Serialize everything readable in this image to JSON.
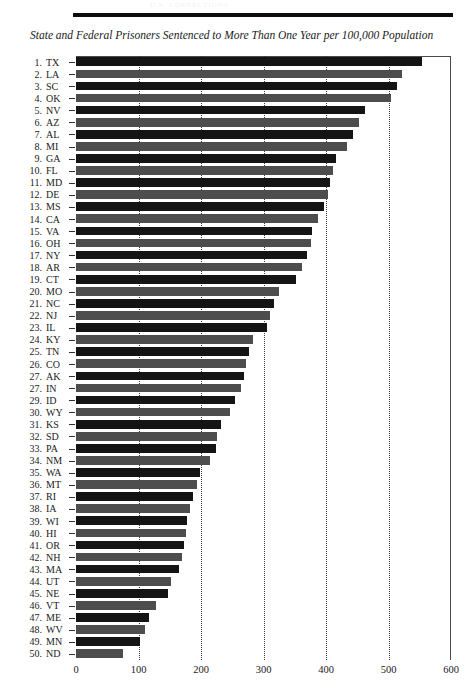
{
  "page": {
    "faint_header": "U.S. CORRECTIONS",
    "title": "State and Federal Prisoners Sentenced to More Than One Year per 100,000 Population"
  },
  "chart_data": {
    "type": "bar",
    "orientation": "horizontal",
    "title": "State and Federal Prisoners Sentenced to More Than One Year per 100,000 Population",
    "xlabel": "",
    "ylabel": "",
    "xlim": [
      0,
      600
    ],
    "xticks": [
      0,
      100,
      200,
      300,
      400,
      500,
      600
    ],
    "grid": "vertical dotted gridlines at 100, 200, 300, 400, 500",
    "legend": "none",
    "ranks": [
      1,
      2,
      3,
      4,
      5,
      6,
      7,
      8,
      9,
      10,
      11,
      12,
      13,
      14,
      15,
      16,
      17,
      18,
      19,
      20,
      21,
      22,
      23,
      24,
      25,
      26,
      27,
      27,
      29,
      30,
      31,
      32,
      33,
      34,
      35,
      36,
      37,
      38,
      39,
      40,
      41,
      42,
      43,
      44,
      45,
      46,
      47,
      48,
      49,
      50
    ],
    "categories": [
      "TX",
      "LA",
      "SC",
      "OK",
      "NV",
      "AZ",
      "AL",
      "MI",
      "GA",
      "FL",
      "MD",
      "DE",
      "MS",
      "CA",
      "VA",
      "OH",
      "NY",
      "AR",
      "CT",
      "MO",
      "NC",
      "NJ",
      "IL",
      "KY",
      "TN",
      "CO",
      "AK",
      "IN",
      "ID",
      "WY",
      "KS",
      "SD",
      "PA",
      "NM",
      "WA",
      "MT",
      "RI",
      "IA",
      "WI",
      "HI",
      "OR",
      "NH",
      "MA",
      "UT",
      "NE",
      "VT",
      "ME",
      "WV",
      "MN",
      "ND"
    ],
    "values": [
      553,
      521,
      514,
      504,
      462,
      452,
      443,
      434,
      416,
      411,
      406,
      403,
      397,
      387,
      378,
      376,
      369,
      362,
      352,
      324,
      317,
      310,
      306,
      283,
      277,
      272,
      268,
      264,
      254,
      247,
      232,
      226,
      224,
      215,
      198,
      194,
      187,
      183,
      178,
      176,
      172,
      169,
      165,
      152,
      147,
      128,
      116,
      110,
      103,
      75
    ]
  }
}
